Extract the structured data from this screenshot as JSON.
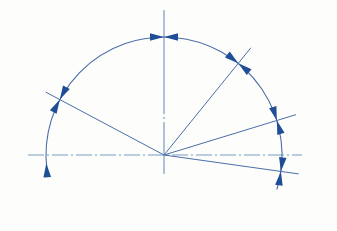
{
  "canvas": {
    "width": 337,
    "height": 231,
    "background_color": "#fdfdfb",
    "title": "Angular dimension diagram"
  },
  "style": {
    "line_color": "#4a6ea8",
    "arc_color": "#4a6ea8",
    "centerline_color": "#7d9bc4",
    "arrow_color": "#1f4e96",
    "line_width": 1,
    "arc_width": 1.1,
    "centerline_width": 1.2,
    "centerline_dash": "14 3 2 3"
  },
  "geometry": {
    "origin": {
      "label": "origin",
      "x": 164,
      "y": 155
    },
    "arc": {
      "label": "dimension-arc",
      "radius": 118,
      "start_angle_deg": -17,
      "end_angle_deg": 187,
      "description": "single sweeping arc centred on origin"
    },
    "axes": [
      {
        "name": "horizontal-axis",
        "kind": "centerline",
        "x1": 28,
        "y1": 155,
        "x2": 302,
        "y2": 155
      },
      {
        "name": "vertical-axis",
        "kind": "centerline",
        "x1": 164,
        "y1": 10,
        "x2": 164,
        "y2": 174
      }
    ],
    "rays": [
      {
        "name": "ray-upper-left",
        "angle_deg": 152,
        "length": 134,
        "description": "ray from origin toward upper left, crosses arc"
      },
      {
        "name": "ray-upper-right",
        "angle_deg": 51,
        "length": 138,
        "description": "ray from origin toward upper right, crosses arc"
      },
      {
        "name": "ray-right-shallow",
        "angle_deg": 17,
        "length": 138,
        "description": "shallow ray from origin to the right, crosses arc"
      },
      {
        "name": "ray-right-below",
        "angle_deg": -8,
        "length": 136,
        "description": "ray from origin sloping slightly below horizontal"
      }
    ],
    "arc_markers": [
      {
        "name": "marker-left-terminator",
        "angle_deg": 184,
        "style": "single-arrow",
        "direction": "cw"
      },
      {
        "name": "marker-upper-left",
        "angle_deg": 152,
        "style": "double-arrow"
      },
      {
        "name": "marker-top",
        "angle_deg": 90,
        "style": "double-arrow"
      },
      {
        "name": "marker-upper-right",
        "angle_deg": 51,
        "style": "double-arrow"
      },
      {
        "name": "marker-right-shallow",
        "angle_deg": 17,
        "style": "double-arrow"
      },
      {
        "name": "marker-right-below",
        "angle_deg": -8,
        "style": "double-arrow"
      }
    ]
  },
  "chart_data": {
    "type": "scatter",
    "xlabel": "",
    "ylabel": "",
    "categories": [
      "ray-upper-left",
      "vertical-axis",
      "ray-upper-right",
      "ray-right-shallow",
      "ray-right-below"
    ],
    "values": [
      152,
      90,
      51,
      17,
      -8
    ],
    "units": "degrees",
    "axis_origin": [
      164,
      155
    ],
    "radius": 118,
    "grid": false,
    "legend": "none"
  }
}
